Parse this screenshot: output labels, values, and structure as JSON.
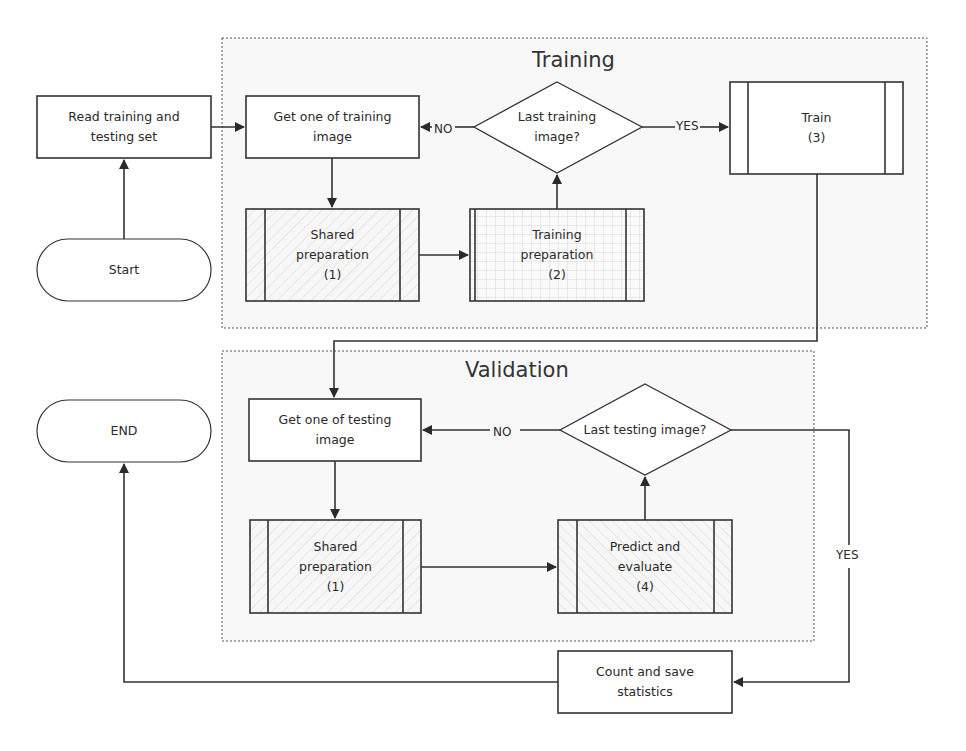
{
  "diagram": {
    "type": "flowchart",
    "regions": [
      {
        "id": "training",
        "title": "Training"
      },
      {
        "id": "validation",
        "title": "Validation"
      }
    ],
    "nodes": {
      "start": {
        "shape": "terminator",
        "label": "Start"
      },
      "read": {
        "shape": "process",
        "line1": "Read training and",
        "line2": "testing set"
      },
      "get_train": {
        "shape": "process",
        "line1": "Get one of training",
        "line2": "image"
      },
      "shared_train": {
        "shape": "predefined-process",
        "line1": "Shared",
        "line2": "preparation",
        "line3": "(1)"
      },
      "train_prep": {
        "shape": "predefined-process",
        "line1": "Training",
        "line2": "preparation",
        "line3": "(2)"
      },
      "last_train": {
        "shape": "decision",
        "line1": "Last training",
        "line2": "image?"
      },
      "train": {
        "shape": "predefined-process",
        "line1": "Train",
        "line2": "(3)"
      },
      "get_test": {
        "shape": "process",
        "line1": "Get one of testing",
        "line2": "image"
      },
      "shared_test": {
        "shape": "predefined-process",
        "line1": "Shared",
        "line2": "preparation",
        "line3": "(1)"
      },
      "last_test": {
        "shape": "decision",
        "line1": "Last testing image?"
      },
      "predict": {
        "shape": "predefined-process",
        "line1": "Predict and",
        "line2": "evaluate",
        "line3": "(4)"
      },
      "count": {
        "shape": "process",
        "line1": "Count and save",
        "line2": "statistics"
      },
      "end": {
        "shape": "terminator",
        "label": "END"
      }
    },
    "edges": [
      {
        "from": "start",
        "to": "read",
        "label": ""
      },
      {
        "from": "read",
        "to": "get_train",
        "label": ""
      },
      {
        "from": "get_train",
        "to": "shared_train",
        "label": ""
      },
      {
        "from": "shared_train",
        "to": "train_prep",
        "label": ""
      },
      {
        "from": "train_prep",
        "to": "last_train",
        "label": ""
      },
      {
        "from": "last_train",
        "to": "get_train",
        "label": "NO"
      },
      {
        "from": "last_train",
        "to": "train",
        "label": "YES"
      },
      {
        "from": "train",
        "to": "get_test",
        "label": ""
      },
      {
        "from": "get_test",
        "to": "shared_test",
        "label": ""
      },
      {
        "from": "shared_test",
        "to": "predict",
        "label": ""
      },
      {
        "from": "predict",
        "to": "last_test",
        "label": ""
      },
      {
        "from": "last_test",
        "to": "get_test",
        "label": "NO"
      },
      {
        "from": "last_test",
        "to": "count",
        "label": "YES"
      },
      {
        "from": "count",
        "to": "end",
        "label": ""
      }
    ],
    "edge_labels": {
      "no_train": "NO",
      "yes_train": "YES",
      "no_test": "NO",
      "yes_test": "YES"
    }
  }
}
